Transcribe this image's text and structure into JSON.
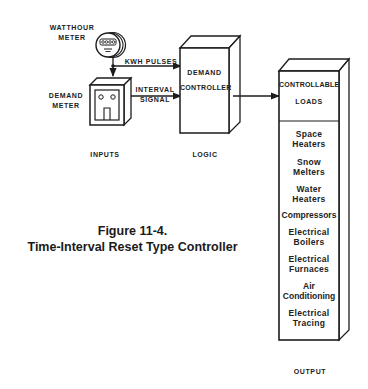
{
  "figure": {
    "number_label": "Figure 11-4.",
    "title": "Time-Interval Reset Type Controller"
  },
  "inputs": {
    "section_label": "INPUTS",
    "watthour_meter": {
      "label_line1": "WATTHOUR",
      "label_line2": "METER",
      "icon": "watthour-meter-icon"
    },
    "demand_meter": {
      "label_line1": "DEMAND",
      "label_line2": "METER",
      "icon": "demand-meter-icon"
    }
  },
  "signals": {
    "kwh": "KWH PULSES",
    "interval_line1": "INTERVAL",
    "interval_line2": "SIGNAL"
  },
  "logic": {
    "section_label": "LOGIC",
    "controller_line1": "DEMAND",
    "controller_line2": "CONTROLLER"
  },
  "output": {
    "section_label": "OUTPUT",
    "header_line1": "CONTROLLABLE",
    "header_line2": "LOADS",
    "loads": [
      {
        "line1": "Space",
        "line2": "Heaters"
      },
      {
        "line1": "Snow",
        "line2": "Melters"
      },
      {
        "line1": "Water",
        "line2": "Heaters"
      },
      {
        "line1": "Compressors",
        "line2": ""
      },
      {
        "line1": "Electrical",
        "line2": "Boilers"
      },
      {
        "line1": "Electrical",
        "line2": "Furnaces"
      },
      {
        "line1": "Air",
        "line2": "Conditioning"
      },
      {
        "line1": "Electrical",
        "line2": "Tracing"
      }
    ]
  },
  "colors": {
    "ink": "#1c1c1c",
    "paper": "#ffffff"
  }
}
